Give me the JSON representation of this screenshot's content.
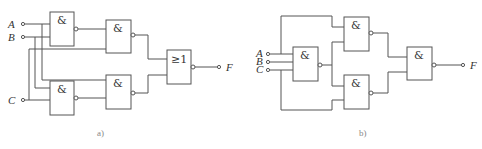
{
  "diagram_a": {
    "caption": "a)",
    "inputs": [
      "A",
      "B",
      "C"
    ],
    "output": "F",
    "gates": [
      {
        "id": "a1",
        "symbol": "&",
        "type": "NAND",
        "inputs": [
          "A",
          "B"
        ]
      },
      {
        "id": "a2",
        "symbol": "&",
        "type": "NAND",
        "inputs": [
          "a1",
          "C"
        ]
      },
      {
        "id": "a3",
        "symbol": "&",
        "type": "NAND",
        "inputs": [
          "B",
          "C"
        ]
      },
      {
        "id": "a4",
        "symbol": "&",
        "type": "NAND",
        "inputs": [
          "A",
          "a3"
        ]
      },
      {
        "id": "a5",
        "symbol": "≥1",
        "type": "NOR",
        "inputs": [
          "a2",
          "a4"
        ]
      }
    ]
  },
  "diagram_b": {
    "caption": "b)",
    "inputs": [
      "A",
      "B",
      "C"
    ],
    "output": "F",
    "gates": [
      {
        "id": "b1",
        "symbol": "&",
        "type": "NAND",
        "inputs": [
          "A",
          "B",
          "C"
        ]
      },
      {
        "id": "b2",
        "symbol": "&",
        "type": "NAND",
        "inputs": [
          "A",
          "b1"
        ]
      },
      {
        "id": "b3",
        "symbol": "&",
        "type": "NAND",
        "inputs": [
          "b1",
          "C"
        ]
      },
      {
        "id": "b4",
        "symbol": "&",
        "type": "NAND",
        "inputs": [
          "b2",
          "b3"
        ]
      }
    ]
  }
}
